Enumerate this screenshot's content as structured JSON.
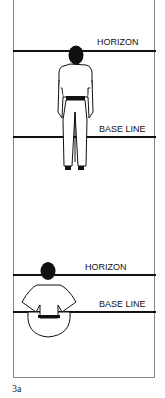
{
  "figure": {
    "label": "3a",
    "top_panel": {
      "horizon_label": "HORIZON",
      "baseline_label": "BASE LINE",
      "figure_pose": "standing-person-back-view"
    },
    "bottom_panel": {
      "horizon_label": "HORIZON",
      "baseline_label": "BASE LINE",
      "figure_pose": "seated-cross-legged-person-back-view"
    },
    "colors": {
      "line": "#111111",
      "frame": "#888888",
      "background": "#ffffff"
    }
  }
}
